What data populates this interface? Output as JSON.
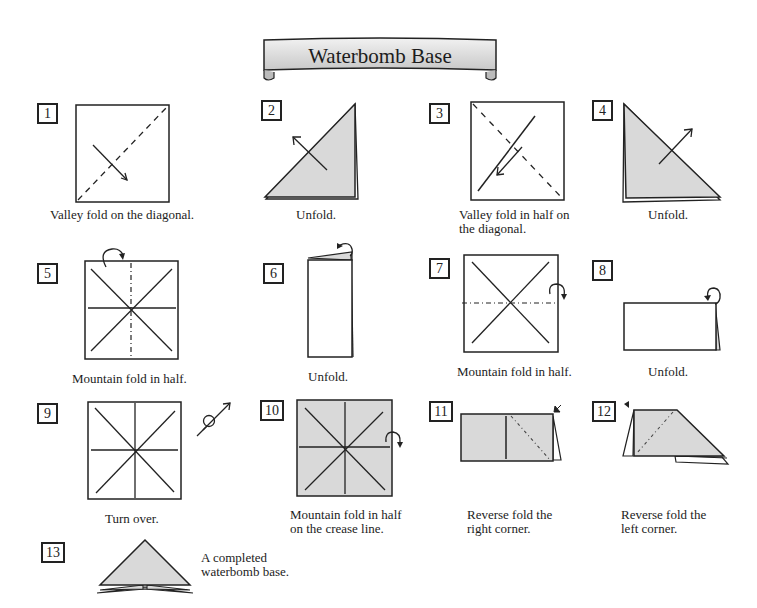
{
  "title": "Waterbomb Base",
  "colors": {
    "paper_shade": "#d9d9d9",
    "line": "#222222",
    "banner_fill": "#e4e4e4"
  },
  "steps": [
    {
      "number": "1",
      "caption": "Valley fold on the diagonal."
    },
    {
      "number": "2",
      "caption": "Unfold."
    },
    {
      "number": "3",
      "caption": "Valley fold in half on\nthe diagonal."
    },
    {
      "number": "4",
      "caption": "Unfold."
    },
    {
      "number": "5",
      "caption": "Mountain fold in half."
    },
    {
      "number": "6",
      "caption": "Unfold."
    },
    {
      "number": "7",
      "caption": "Mountain fold in half."
    },
    {
      "number": "8",
      "caption": "Unfold."
    },
    {
      "number": "9",
      "caption": "Turn over."
    },
    {
      "number": "10",
      "caption": "Mountain fold in half\non the crease line."
    },
    {
      "number": "11",
      "caption": "Reverse fold the\nright corner."
    },
    {
      "number": "12",
      "caption": "Reverse fold the\nleft corner."
    },
    {
      "number": "13",
      "caption": "A completed\nwaterbomb base."
    }
  ]
}
